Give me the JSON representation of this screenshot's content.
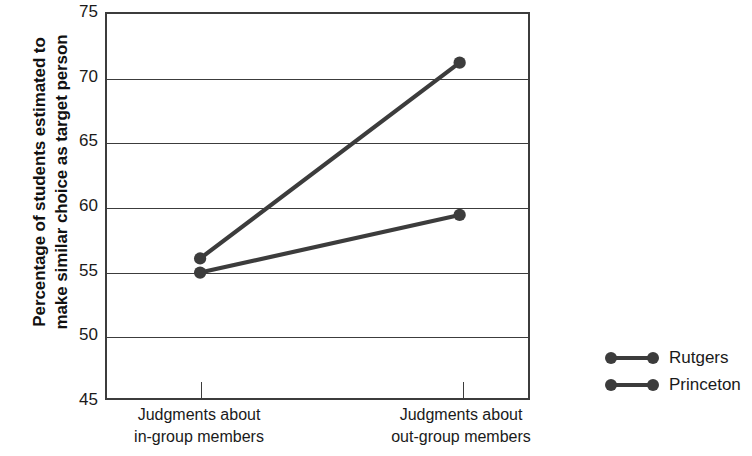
{
  "chart_data": {
    "type": "line",
    "title": "",
    "xlabel": "",
    "ylabel": "Percentage of students estimated to make similar choice as target person",
    "ylabel_line1": "Percentage of students estimated to",
    "ylabel_line2": "make similar choice as target person",
    "categories": [
      "Judgments about in-group members",
      "Judgments about out-group members"
    ],
    "category_lines": [
      [
        "Judgments about",
        "in-group members"
      ],
      [
        "Judgments about",
        "out-group members"
      ]
    ],
    "series": [
      {
        "name": "Rutgers",
        "values": [
          55.9,
          71.2
        ],
        "color": "#3c3c3c"
      },
      {
        "name": "Princeton",
        "values": [
          54.8,
          59.3
        ],
        "color": "#3c3c3c"
      }
    ],
    "ylim": [
      45,
      75
    ],
    "yticks": [
      75,
      70,
      65,
      60,
      55,
      50,
      45
    ],
    "ytick_labels": [
      "75",
      "70",
      "65",
      "60",
      "55",
      "50",
      "45"
    ],
    "grid": true,
    "legend_position": "right"
  },
  "legend": {
    "items": [
      {
        "label": "Rutgers"
      },
      {
        "label": "Princeton"
      }
    ]
  },
  "colors": {
    "line": "#3c3c3c",
    "marker": "#3c3c3c",
    "frame": "#3c3c3c",
    "text": "#1a1a1a",
    "background": "#ffffff"
  }
}
